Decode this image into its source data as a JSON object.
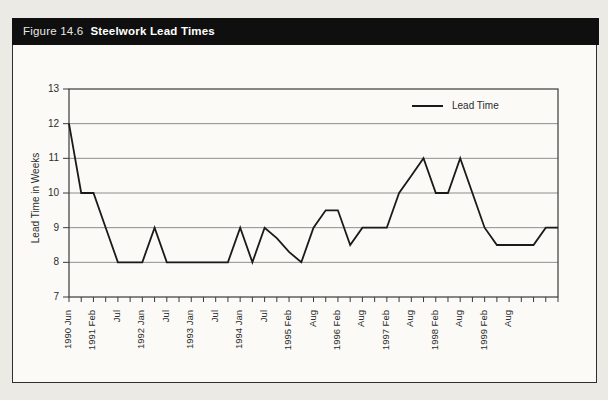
{
  "figure": {
    "label": "Figure 14.6",
    "title": "Steelwork Lead Times"
  },
  "colors": {
    "series_line": "#1a1a1a",
    "gridline": "#8d8d8d",
    "axis_frame": "#3a3a3a",
    "title_bar_bg": "#0f0f0f",
    "title_bar_text": "#ffffff",
    "figure_bg": "#fbfaf7",
    "page_bg": "#eceae5"
  },
  "chart_data": {
    "type": "line",
    "title": "",
    "xlabel": "",
    "ylabel": "Lead Time in Weeks",
    "ylim": [
      7,
      13
    ],
    "yticks": [
      7,
      8,
      9,
      10,
      11,
      12,
      13
    ],
    "grid": "horizontal",
    "legend": {
      "position": "top-right-inside",
      "entries": [
        {
          "label": "Lead Time",
          "color": "#1a1a1a"
        }
      ]
    },
    "x_labels": [
      "1990 Jun",
      "",
      "1991 Feb",
      "",
      "Jul",
      "",
      "1992 Jan",
      "",
      "Jul",
      "",
      "1993 Jan",
      "",
      "Jul",
      "",
      "1994 Jan",
      "",
      "Jul",
      "",
      "1995 Feb",
      "",
      "Aug",
      "",
      "1996 Feb",
      "",
      "Aug",
      "",
      "1997 Feb",
      "",
      "Aug",
      "",
      "1998 Feb",
      "",
      "Aug",
      "",
      "1999 Feb",
      "",
      "Aug",
      "",
      "",
      "",
      ""
    ],
    "series": [
      {
        "name": "Lead Time",
        "color": "#1a1a1a",
        "values": [
          12,
          10,
          10,
          9,
          8,
          8,
          8,
          9,
          8,
          8,
          8,
          8,
          8,
          8,
          9,
          8,
          9,
          8.7,
          8.3,
          8,
          9,
          9.5,
          9.5,
          8.5,
          9,
          9,
          9,
          10,
          10.5,
          11,
          10,
          10,
          11,
          10,
          9,
          8.5,
          8.5,
          8.5,
          8.5,
          9,
          9
        ]
      }
    ]
  }
}
